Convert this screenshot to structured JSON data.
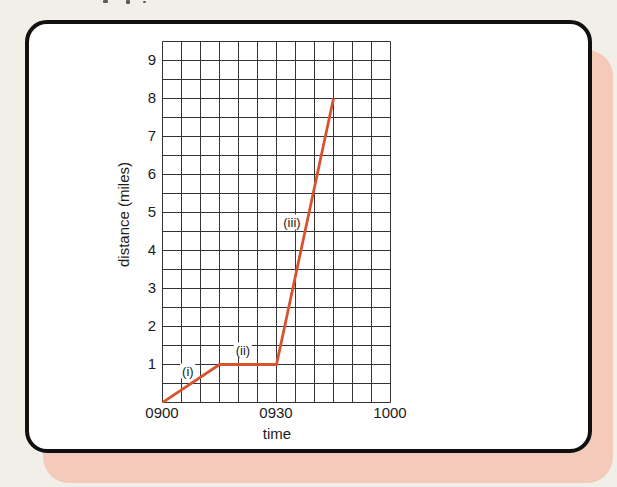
{
  "figure": {
    "xlabel": "time",
    "ylabel": "distance (miles)"
  },
  "chart_data": {
    "type": "line",
    "title": "",
    "xlabel": "time",
    "ylabel": "distance (miles)",
    "x_unit": "minutes after 0900",
    "xlim_minutes": [
      0,
      60
    ],
    "ylim_miles": [
      0,
      9.5
    ],
    "x_minor_step_minutes": 5,
    "y_minor_step_miles": 0.5,
    "grid": true,
    "x_ticks": [
      {
        "label": "0900",
        "t": 0
      },
      {
        "label": "0930",
        "t": 30
      },
      {
        "label": "1000",
        "t": 60
      }
    ],
    "y_ticks": [
      {
        "label": "1",
        "d": 1
      },
      {
        "label": "2",
        "d": 2
      },
      {
        "label": "3",
        "d": 3
      },
      {
        "label": "4",
        "d": 4
      },
      {
        "label": "5",
        "d": 5
      },
      {
        "label": "6",
        "d": 6
      },
      {
        "label": "7",
        "d": 7
      },
      {
        "label": "8",
        "d": 8
      },
      {
        "label": "9",
        "d": 9
      }
    ],
    "series": [
      {
        "name": "journey",
        "color": "#d9532e",
        "points": [
          {
            "time": "0900",
            "t": 0,
            "d": 0
          },
          {
            "time": "0915",
            "t": 15,
            "d": 1
          },
          {
            "time": "0930",
            "t": 30,
            "d": 1
          },
          {
            "time": "0945",
            "t": 45,
            "d": 8
          }
        ]
      }
    ],
    "annotations": [
      {
        "label": "(i)",
        "t": 6.8,
        "d": 0.82
      },
      {
        "label": "(ii)",
        "t": 21.3,
        "d": 1.37
      },
      {
        "label": "(iii)",
        "t": 34.2,
        "d": 4.74
      }
    ],
    "colors": {
      "line": "#d9532e",
      "grid": "#333333",
      "pink_mat": "#f4cabb",
      "frame": "#101010",
      "page_bg": "#f2efe9",
      "panel": "#ffffff"
    }
  }
}
